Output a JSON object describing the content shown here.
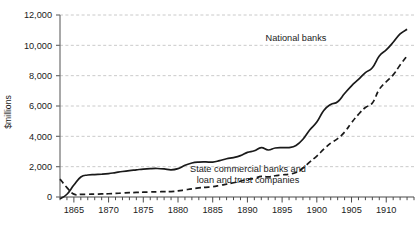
{
  "chart_data": {
    "type": "line",
    "title": "",
    "subtitle": "",
    "xlabel": "",
    "ylabel": "$millions",
    "xlim": [
      1863,
      1914
    ],
    "ylim": [
      0,
      12000
    ],
    "grid": true,
    "legend_position": "inline-annotation",
    "y_ticks": [
      0,
      2000,
      4000,
      6000,
      8000,
      10000,
      12000
    ],
    "y_tick_labels": [
      "0",
      "2,000",
      "4,000",
      "6,000",
      "8,000",
      "10,000",
      "12,000"
    ],
    "x_ticks": [
      1865,
      1870,
      1875,
      1880,
      1885,
      1890,
      1895,
      1900,
      1905,
      1910
    ],
    "x_tick_labels": [
      "1865",
      "1870",
      "1875",
      "1880",
      "1885",
      "1890",
      "1895",
      "1900",
      "1905",
      "1910"
    ],
    "x_minor_tick_interval": 1,
    "series": [
      {
        "name": "National banks",
        "style": "solid",
        "color": "#1a1a1a",
        "label_text": "National banks",
        "x": [
          1863,
          1864,
          1865,
          1866,
          1867,
          1868,
          1869,
          1870,
          1871,
          1872,
          1873,
          1874,
          1875,
          1876,
          1877,
          1878,
          1879,
          1880,
          1881,
          1882,
          1883,
          1884,
          1885,
          1886,
          1887,
          1888,
          1889,
          1890,
          1891,
          1892,
          1893,
          1894,
          1895,
          1896,
          1897,
          1898,
          1899,
          1900,
          1901,
          1902,
          1903,
          1904,
          1905,
          1906,
          1907,
          1908,
          1909,
          1910,
          1911,
          1912,
          1913
        ],
        "values": [
          -120,
          180,
          790,
          1320,
          1450,
          1480,
          1500,
          1540,
          1610,
          1680,
          1740,
          1790,
          1840,
          1870,
          1880,
          1850,
          1790,
          1870,
          2090,
          2240,
          2300,
          2310,
          2300,
          2400,
          2520,
          2600,
          2730,
          2940,
          3050,
          3250,
          3100,
          3230,
          3260,
          3260,
          3400,
          3810,
          4440,
          4940,
          5700,
          6100,
          6280,
          6820,
          7330,
          7750,
          8200,
          8520,
          9300,
          9700,
          10200,
          10750,
          11060
        ]
      },
      {
        "name": "State commercial banks and loan and trust companies",
        "style": "dashed",
        "color": "#1a1a1a",
        "label_text": "State commercial banks and\nloan and trust companies",
        "x": [
          1863,
          1864,
          1865,
          1866,
          1867,
          1868,
          1869,
          1870,
          1871,
          1872,
          1873,
          1874,
          1875,
          1876,
          1877,
          1878,
          1879,
          1880,
          1881,
          1882,
          1883,
          1884,
          1885,
          1886,
          1887,
          1888,
          1889,
          1890,
          1891,
          1892,
          1893,
          1894,
          1895,
          1896,
          1897,
          1898,
          1899,
          1900,
          1901,
          1902,
          1903,
          1904,
          1905,
          1906,
          1907,
          1908,
          1909,
          1910,
          1911,
          1912,
          1913
        ],
        "values": [
          1180,
          620,
          190,
          175,
          180,
          190,
          200,
          215,
          235,
          260,
          285,
          300,
          315,
          330,
          345,
          350,
          360,
          400,
          470,
          540,
          600,
          640,
          680,
          760,
          850,
          940,
          1040,
          1170,
          1230,
          1360,
          1330,
          1400,
          1460,
          1500,
          1620,
          1900,
          2320,
          2700,
          3150,
          3550,
          3850,
          4280,
          4900,
          5450,
          5900,
          6200,
          7100,
          7600,
          8050,
          8700,
          9300
        ]
      }
    ],
    "annotations": [
      {
        "text": "National banks",
        "x_px": 296,
        "y_px": 41
      },
      {
        "text": "State commercial banks and",
        "x_px": 248,
        "y_px": 172
      },
      {
        "text": "loan and trust companies",
        "x_px": 248,
        "y_px": 183
      }
    ]
  }
}
